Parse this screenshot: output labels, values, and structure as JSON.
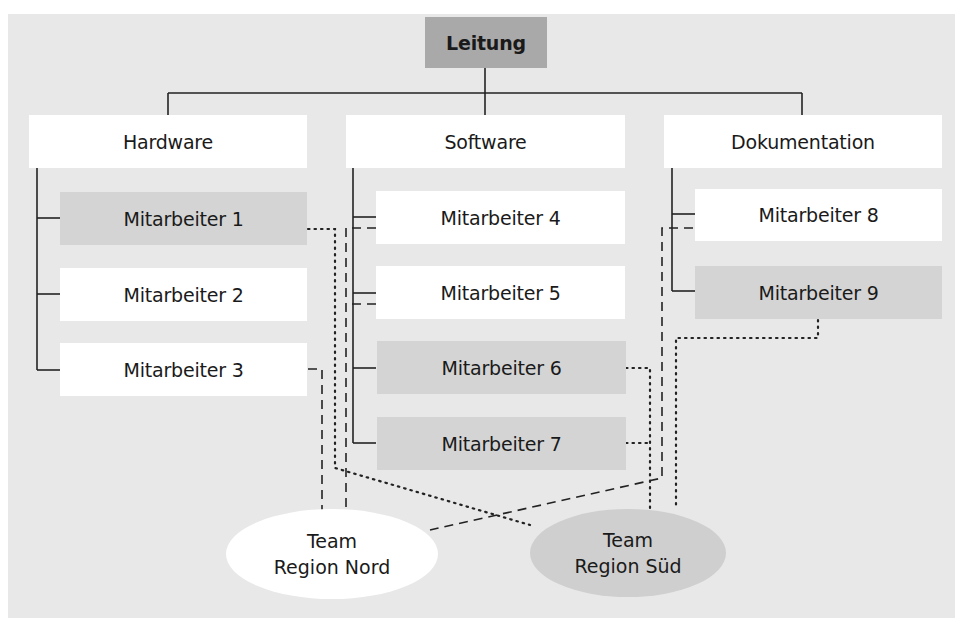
{
  "diagram": {
    "root": {
      "label": "Leitung"
    },
    "departments": [
      {
        "label": "Hardware",
        "members": [
          "Mitarbeiter 1",
          "Mitarbeiter 2",
          "Mitarbeiter 3"
        ]
      },
      {
        "label": "Software",
        "members": [
          "Mitarbeiter 4",
          "Mitarbeiter 5",
          "Mitarbeiter 6",
          "Mitarbeiter 7"
        ]
      },
      {
        "label": "Dokumentation",
        "members": [
          "Mitarbeiter 8",
          "Mitarbeiter 9"
        ]
      }
    ],
    "teams": [
      {
        "line1": "Team",
        "line2": "Region Nord",
        "members": [
          "Mitarbeiter 3",
          "Mitarbeiter 4",
          "Mitarbeiter 5",
          "Mitarbeiter 8"
        ],
        "connector": "dashed"
      },
      {
        "line1": "Team",
        "line2": "Region Süd",
        "members": [
          "Mitarbeiter 1",
          "Mitarbeiter 6",
          "Mitarbeiter 7",
          "Mitarbeiter 9"
        ],
        "connector": "dotted"
      }
    ]
  },
  "colors": {
    "background": "#e8e8e8",
    "root_fill": "#a9a9a9",
    "highlight_fill": "#d4d4d4",
    "box_fill": "#ffffff",
    "line": "#222222"
  }
}
